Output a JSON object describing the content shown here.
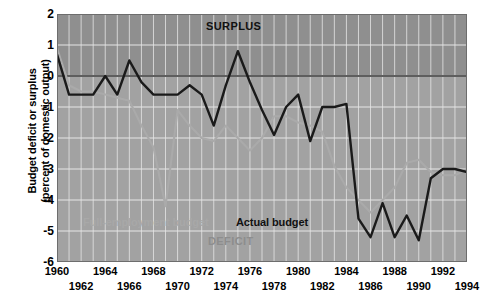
{
  "chart_data": {
    "type": "line",
    "title": "",
    "xlabel": "",
    "ylabel": "Budget deficit or surplus (percent of domestic output)",
    "ylabel_line1": "Budget deficit or surplus",
    "ylabel_line2": "(percent of domestic output)",
    "xlim": [
      1960,
      1994
    ],
    "ylim": [
      -6,
      2
    ],
    "yticks": [
      2,
      1,
      0,
      -1,
      -2,
      -3,
      -4,
      -5,
      -6
    ],
    "xticks_row_a": [
      1960,
      1964,
      1968,
      1972,
      1976,
      1980,
      1984,
      1988,
      1992
    ],
    "xticks_row_b": [
      1962,
      1966,
      1970,
      1974,
      1978,
      1982,
      1986,
      1990,
      1994
    ],
    "grid": true,
    "legend_position": "in-plot",
    "annotations": [
      {
        "name": "surplus-band-label",
        "text": "SURPLUS",
        "x": 1972,
        "y": 1.6,
        "color": "#111111"
      },
      {
        "name": "deficit-band-label",
        "text": "DEFICIT",
        "x": 1972,
        "y": -5.3,
        "color": "#8d8d8d"
      },
      {
        "name": "full-employment-series-label",
        "text": "Full-employment budget",
        "x": 1964,
        "y": -4.7,
        "color": "#a8a8a8"
      },
      {
        "name": "actual-budget-series-label",
        "text": "Actual budget",
        "x": 1977,
        "y": -4.7,
        "color": "#111111"
      }
    ],
    "x": [
      1960,
      1961,
      1962,
      1963,
      1964,
      1965,
      1966,
      1967,
      1968,
      1969,
      1970,
      1971,
      1972,
      1973,
      1974,
      1975,
      1976,
      1977,
      1978,
      1979,
      1980,
      1981,
      1982,
      1983,
      1984,
      1985,
      1986,
      1987,
      1988,
      1989,
      1990,
      1991,
      1992,
      1993,
      1994
    ],
    "series": [
      {
        "name": "Actual budget",
        "color": "#1a1a1a",
        "values": [
          0.7,
          -0.6,
          -0.6,
          -0.6,
          0.0,
          -0.6,
          0.5,
          -0.2,
          -0.6,
          -0.6,
          -0.6,
          -0.3,
          -0.6,
          -1.6,
          -0.3,
          0.8,
          -0.2,
          -1.1,
          -1.9,
          -1.0,
          -0.6,
          -2.1,
          -1.0,
          -1.0,
          -0.9,
          -4.6,
          -5.2,
          -4.1,
          -5.2,
          -4.5,
          -5.3,
          -3.3,
          -3.0,
          -3.0,
          -3.1
        ]
      },
      {
        "name": "Full-employment budget",
        "color": "#aaaaaa",
        "values": [
          0.9,
          -0.3,
          -0.5,
          -0.5,
          -0.6,
          -0.7,
          -0.8,
          -1.6,
          -2.3,
          -4.2,
          -1.1,
          -1.6,
          -2.0,
          -2.1,
          -1.6,
          -2.0,
          -2.4,
          -2.0,
          -1.3,
          -1.3,
          -1.5,
          -1.6,
          -1.8,
          -2.9,
          -3.6,
          -4.0,
          -4.4,
          -4.0,
          -3.6,
          -2.8,
          -2.7,
          -3.1,
          -3.2,
          -3.2,
          -3.0
        ]
      }
    ]
  },
  "axis": {
    "y_labels": [
      "2",
      "1",
      "0",
      "-1",
      "-2",
      "-3",
      "-4",
      "-5",
      "-6"
    ],
    "x_labels_row_a": [
      "1960",
      "1964",
      "1968",
      "1972",
      "1976",
      "1980",
      "1984",
      "1988",
      "1992"
    ],
    "x_labels_row_b": [
      "1962",
      "1966",
      "1970",
      "1974",
      "1978",
      "1982",
      "1986",
      "1990",
      "1994"
    ]
  },
  "colors": {
    "surplus_band": "#8f8f8f",
    "deficit_band": "#a2a2a2",
    "gridline": "#e6e6e6",
    "zero_line": "#5e5e5e",
    "actual_line": "#1a1a1a",
    "full_employment_line": "#aaaaaa",
    "page_background": "#ffffff"
  }
}
